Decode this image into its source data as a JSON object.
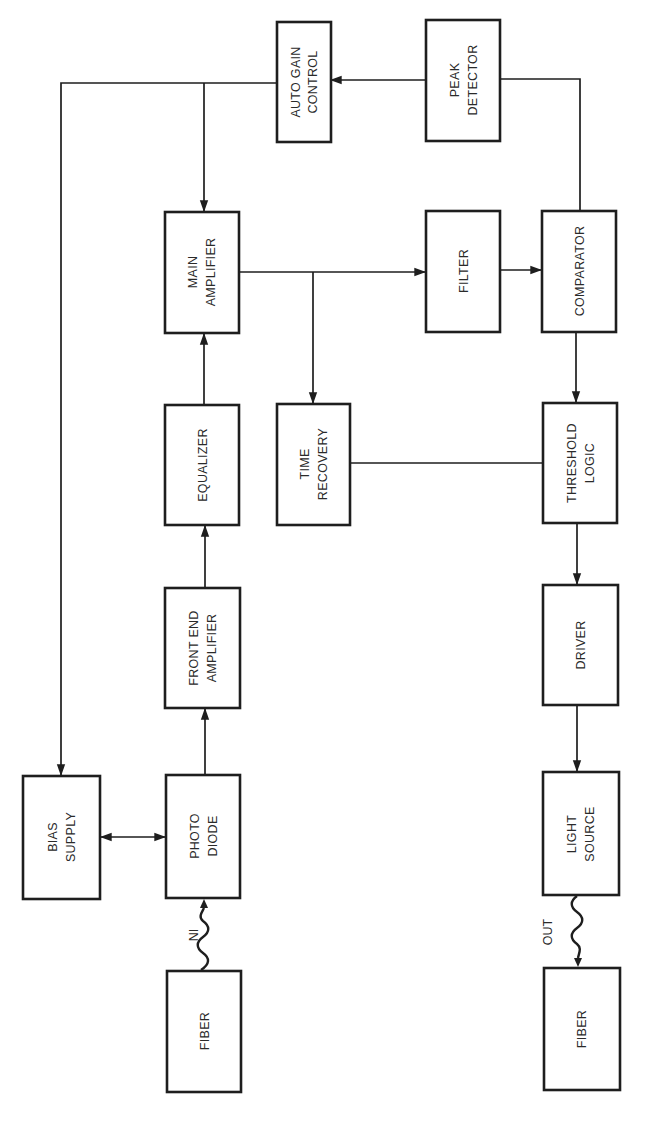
{
  "diagram": {
    "type": "block-diagram",
    "orientation": "rotated-90-ccw",
    "blocks": {
      "auto_gain_control": {
        "line1": "AUTO GAIN",
        "line2": "CONTROL"
      },
      "peak_detector": {
        "line1": "PEAK",
        "line2": "DETECTOR"
      },
      "main_amplifier": {
        "line1": "MAIN",
        "line2": "AMPLIFIER"
      },
      "filter": {
        "line1": "FILTER"
      },
      "comparator": {
        "line1": "COMPARATOR"
      },
      "equalizer": {
        "line1": "EQUALIZER"
      },
      "time_recovery": {
        "line1": "TIME",
        "line2": "RECOVERY"
      },
      "threshold_logic": {
        "line1": "THRESHOLD",
        "line2": "LOGIC"
      },
      "front_end_amplifier": {
        "line1": "FRONT END",
        "line2": "AMPLIFIER"
      },
      "driver": {
        "line1": "DRIVER"
      },
      "bias_supply": {
        "line1": "BIAS",
        "line2": "SUPPLY"
      },
      "photo_diode": {
        "line1": "PHOTO",
        "line2": "DIODE"
      },
      "light_source": {
        "line1": "LIGHT",
        "line2": "SOURCE"
      },
      "fiber_in": {
        "line1": "FIBER"
      },
      "fiber_out": {
        "line1": "FIBER"
      }
    },
    "labels": {
      "in": "IN",
      "out": "OUT"
    },
    "connections": [
      {
        "from": "fiber_in",
        "to": "photo_diode",
        "style": "wavy",
        "label": "IN"
      },
      {
        "from": "bias_supply",
        "to": "photo_diode",
        "style": "bidirectional"
      },
      {
        "from": "photo_diode",
        "to": "front_end_amplifier"
      },
      {
        "from": "front_end_amplifier",
        "to": "equalizer"
      },
      {
        "from": "equalizer",
        "to": "main_amplifier"
      },
      {
        "from": "main_amplifier",
        "to": "filter"
      },
      {
        "from": "main_amplifier",
        "to": "time_recovery"
      },
      {
        "from": "filter",
        "to": "comparator"
      },
      {
        "from": "comparator",
        "to": "peak_detector"
      },
      {
        "from": "peak_detector",
        "to": "auto_gain_control"
      },
      {
        "from": "auto_gain_control",
        "to": "main_amplifier"
      },
      {
        "from": "auto_gain_control",
        "to": "bias_supply"
      },
      {
        "from": "comparator",
        "to": "threshold_logic"
      },
      {
        "from": "time_recovery",
        "to": "threshold_logic"
      },
      {
        "from": "threshold_logic",
        "to": "driver"
      },
      {
        "from": "driver",
        "to": "light_source"
      },
      {
        "from": "light_source",
        "to": "fiber_out",
        "style": "wavy",
        "label": "OUT"
      }
    ],
    "colors": {
      "ink": "#1e1e1e",
      "background": "#ffffff"
    }
  }
}
